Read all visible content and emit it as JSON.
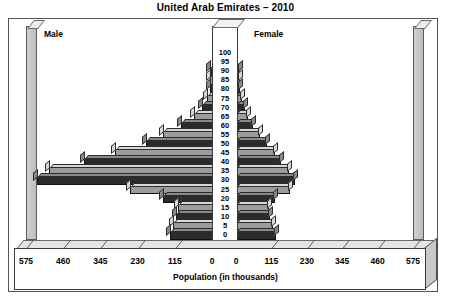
{
  "chart_data": {
    "type": "bar",
    "subtype": "population-pyramid",
    "title": "United Arab Emirates – 2010",
    "xlabel": "Population (in thousands)",
    "ylabel": "",
    "grid": false,
    "legend_position": "in-plot-corners",
    "xlim": [
      -575,
      575
    ],
    "xticks_left": [
      "575",
      "460",
      "345",
      "230",
      "115",
      "0"
    ],
    "xticks_right": [
      "0",
      "115",
      "230",
      "345",
      "460",
      "575"
    ],
    "xtick_values": [
      575,
      460,
      345,
      230,
      115,
      0,
      0,
      115,
      230,
      345,
      460,
      575
    ],
    "categories": [
      "0",
      "5",
      "10",
      "15",
      "20",
      "25",
      "30",
      "35",
      "40",
      "45",
      "50",
      "55",
      "60",
      "65",
      "70",
      "75",
      "80",
      "85",
      "90",
      "95",
      "100"
    ],
    "series": [
      {
        "name": "Male",
        "side": "left",
        "values": [
          130,
          120,
          110,
          105,
          150,
          255,
          540,
          505,
          395,
          300,
          205,
          150,
          95,
          55,
          30,
          16,
          7,
          3,
          1,
          0,
          0
        ]
      },
      {
        "name": "Female",
        "side": "right",
        "values": [
          125,
          115,
          105,
          100,
          120,
          170,
          185,
          165,
          140,
          120,
          95,
          70,
          48,
          34,
          22,
          13,
          6,
          2,
          1,
          0,
          0
        ]
      }
    ]
  },
  "colors": {
    "bar_dark": "#2b2b2b",
    "bar_dark_top": "#8a8a8a",
    "bar_light": "#9c9c9c",
    "bar_light_top": "#d8d8d8",
    "wall": "#c6c6c6",
    "floor": "#e4e4e4",
    "frame": "#555555",
    "background": "#ffffff"
  },
  "panels": {
    "left_label": "Male",
    "right_label": "Female"
  }
}
